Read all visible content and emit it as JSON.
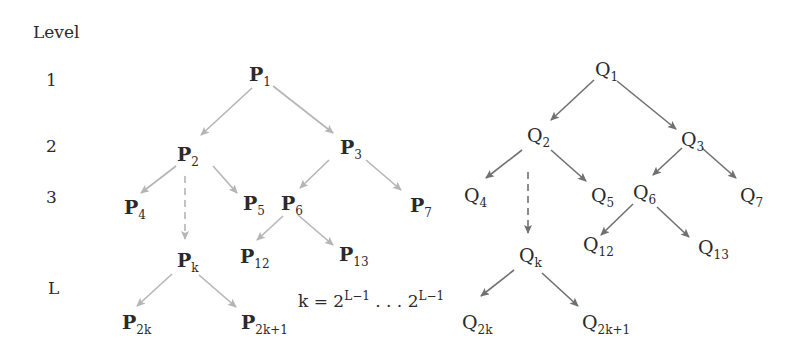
{
  "diagram": {
    "colors": {
      "p_edges": "#b5b5b5",
      "q_edges": "#707070",
      "text": "#2a2a2a"
    },
    "levels": {
      "header": "Level",
      "items": [
        {
          "label": "1",
          "y": 56
        },
        {
          "label": "2",
          "y": 122
        },
        {
          "label": "3",
          "y": 173
        },
        {
          "label": "L",
          "y": 256
        }
      ]
    },
    "p_tree": {
      "nodes": [
        {
          "id": "p1",
          "base": "P",
          "sub": "1",
          "x": 250,
          "y": 62
        },
        {
          "id": "p2",
          "base": "P",
          "sub": "2",
          "x": 178,
          "y": 140
        },
        {
          "id": "p3",
          "base": "P",
          "sub": "3",
          "x": 340,
          "y": 140
        },
        {
          "id": "p4",
          "base": "P",
          "sub": "4",
          "x": 125,
          "y": 199
        },
        {
          "id": "p5",
          "base": "P",
          "sub": "5",
          "x": 244,
          "y": 193
        },
        {
          "id": "p6",
          "base": "P",
          "sub": "6",
          "x": 282,
          "y": 194
        },
        {
          "id": "p7",
          "base": "P",
          "sub": "7",
          "x": 410,
          "y": 195
        },
        {
          "id": "pk",
          "base": "P",
          "sub": "k",
          "x": 178,
          "y": 250
        },
        {
          "id": "p12",
          "base": "P",
          "sub": "12",
          "x": 241,
          "y": 246
        },
        {
          "id": "p13",
          "base": "P",
          "sub": "13",
          "x": 339,
          "y": 244
        },
        {
          "id": "p2k",
          "base": "P",
          "sub": "2k",
          "x": 122,
          "y": 302
        },
        {
          "id": "p2k1",
          "base": "P",
          "sub": "2k+1",
          "x": 241,
          "y": 302
        }
      ]
    },
    "q_tree": {
      "nodes": [
        {
          "id": "q1",
          "base": "Q",
          "sub": "1",
          "x": 595,
          "y": 58
        },
        {
          "id": "q2",
          "base": "Q",
          "sub": "2",
          "x": 527,
          "y": 122
        },
        {
          "id": "q3",
          "base": "Q",
          "sub": "3",
          "x": 681,
          "y": 130
        },
        {
          "id": "q4",
          "base": "Q",
          "sub": "4",
          "x": 464,
          "y": 185
        },
        {
          "id": "q5",
          "base": "Q",
          "sub": "5",
          "x": 591,
          "y": 185
        },
        {
          "id": "q6",
          "base": "Q",
          "sub": "6",
          "x": 632,
          "y": 182
        },
        {
          "id": "q7",
          "base": "Q",
          "sub": "7",
          "x": 740,
          "y": 185
        },
        {
          "id": "qk",
          "base": "Q",
          "sub": "k",
          "x": 519,
          "y": 246
        },
        {
          "id": "q12",
          "base": "Q",
          "sub": "12",
          "x": 583,
          "y": 232
        },
        {
          "id": "q13",
          "base": "Q",
          "sub": "13",
          "x": 698,
          "y": 235
        },
        {
          "id": "q2k",
          "base": "Q",
          "sub": "2k",
          "x": 462,
          "y": 310
        },
        {
          "id": "q2k1",
          "base": "Q",
          "sub": "2k+1",
          "x": 582,
          "y": 310
        }
      ]
    },
    "formula": {
      "prefix": "k = 2",
      "sup1": "L−1",
      "middle": " . . . 2",
      "sup2": "L−1"
    }
  }
}
